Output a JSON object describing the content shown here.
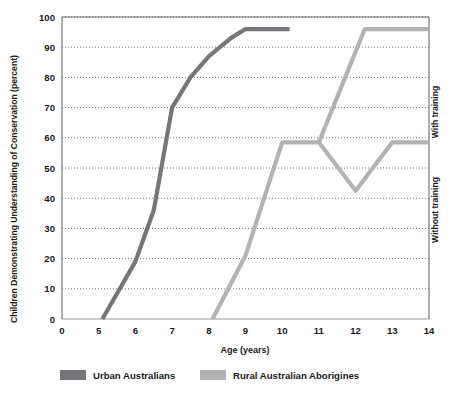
{
  "chart_data": {
    "type": "line",
    "title": "",
    "xlabel": "Age (years)",
    "ylabel": "Children Demonstrating Understanding of Conservation (percent)",
    "xlim": [
      0,
      14
    ],
    "ylim": [
      0,
      100
    ],
    "xticks": [
      "0",
      "5",
      "6",
      "7",
      "8",
      "9",
      "10",
      "11",
      "12",
      "13",
      "14"
    ],
    "xtick_values": [
      0,
      5,
      6,
      7,
      8,
      9,
      10,
      11,
      12,
      13,
      14
    ],
    "yticks": [
      "0",
      "10",
      "20",
      "30",
      "40",
      "50",
      "60",
      "70",
      "80",
      "90",
      "100"
    ],
    "ytick_values": [
      0,
      10,
      20,
      30,
      40,
      50,
      60,
      70,
      80,
      90,
      100
    ],
    "grid": "horizontal-dotted",
    "legend_position": "below-plot",
    "series": [
      {
        "name": "Urban Australians",
        "color": "#76767a",
        "points": [
          {
            "x": 5.1,
            "y": 0
          },
          {
            "x": 6.0,
            "y": 19
          },
          {
            "x": 6.5,
            "y": 36
          },
          {
            "x": 7.0,
            "y": 70
          },
          {
            "x": 7.5,
            "y": 80
          },
          {
            "x": 8.0,
            "y": 87
          },
          {
            "x": 8.6,
            "y": 93
          },
          {
            "x": 9.0,
            "y": 96
          },
          {
            "x": 10.2,
            "y": 96
          }
        ]
      },
      {
        "name": "Rural Australian Aborigines",
        "color": "#b3b3b3",
        "points": [
          {
            "x": 8.1,
            "y": 0
          },
          {
            "x": 9.0,
            "y": 21
          },
          {
            "x": 10.0,
            "y": 58.5
          },
          {
            "x": 11.0,
            "y": 58.5
          },
          {
            "x": 12.0,
            "y": 42.5
          },
          {
            "x": 13.0,
            "y": 58.5
          },
          {
            "x": 14.0,
            "y": 58.5
          }
        ]
      },
      {
        "name": "Rural Australian Aborigines (with training branch)",
        "color": "#b3b3b3",
        "points": [
          {
            "x": 11.0,
            "y": 58.5
          },
          {
            "x": 12.25,
            "y": 96
          },
          {
            "x": 14.0,
            "y": 96
          }
        ]
      }
    ],
    "annotations": [
      {
        "label": "With training",
        "position": "right-upper",
        "rotation": 90
      },
      {
        "label": "Without training",
        "position": "right-lower",
        "rotation": 90
      }
    ]
  },
  "legend": {
    "items": [
      {
        "label": "Urban Australians",
        "color": "#76767a"
      },
      {
        "label": "Rural Australian Aborigines",
        "color": "#b3b3b3"
      }
    ]
  },
  "colors": {
    "urban": "#76767a",
    "rural": "#b3b3b3",
    "axis": "#9a9a9a",
    "grid": "#555555",
    "text": "#1a1a1a",
    "background": "#ffffff"
  }
}
